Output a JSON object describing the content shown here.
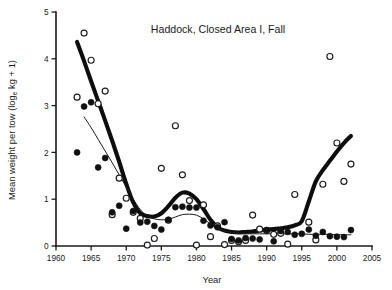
{
  "chart_data": {
    "type": "scatter",
    "title": "Haddock, Closed Area I, Fall",
    "xlabel": "Year",
    "ylabel_main": "Mean weight per tow (log",
    "ylabel_sub": "e",
    "ylabel_tail": " kg + 1)",
    "ylabel_full": "Mean weight per tow (log e kg + 1)",
    "xlim": [
      1960,
      2005
    ],
    "ylim": [
      0,
      5
    ],
    "xticks": [
      1960,
      1965,
      1970,
      1975,
      1980,
      1985,
      1990,
      1995,
      2000,
      2005
    ],
    "yticks": [
      0,
      1,
      2,
      3,
      4,
      5
    ],
    "grid": false,
    "legend": "none",
    "series": [
      {
        "name": "Closed Area I (closed circles)",
        "marker": "filled-circle",
        "color": "#101010",
        "points": [
          [
            1963,
            2.0
          ],
          [
            1964,
            2.98
          ],
          [
            1965,
            3.07
          ],
          [
            1966,
            1.68
          ],
          [
            1967,
            1.88
          ],
          [
            1968,
            0.72
          ],
          [
            1969,
            0.86
          ],
          [
            1970,
            0.37
          ],
          [
            1971,
            0.75
          ],
          [
            1972,
            0.5
          ],
          [
            1973,
            0.52
          ],
          [
            1974,
            0.43
          ],
          [
            1975,
            0.35
          ],
          [
            1976,
            0.56
          ],
          [
            1977,
            0.83
          ],
          [
            1978,
            0.84
          ],
          [
            1979,
            0.82
          ],
          [
            1980,
            0.82
          ],
          [
            1981,
            0.54
          ],
          [
            1982,
            0.44
          ],
          [
            1983,
            0.4
          ],
          [
            1984,
            0.51
          ],
          [
            1985,
            0.15
          ],
          [
            1986,
            0.12
          ],
          [
            1987,
            0.17
          ],
          [
            1988,
            0.16
          ],
          [
            1989,
            0.14
          ],
          [
            1990,
            0.34
          ],
          [
            1991,
            0.1
          ],
          [
            1992,
            0.32
          ],
          [
            1993,
            0.3
          ],
          [
            1994,
            0.24
          ],
          [
            1995,
            0.26
          ],
          [
            1996,
            0.35
          ],
          [
            1997,
            0.22
          ],
          [
            1998,
            0.3
          ],
          [
            1999,
            0.21
          ],
          [
            2000,
            0.2
          ],
          [
            2001,
            0.19
          ],
          [
            2002,
            0.34
          ]
        ]
      },
      {
        "name": "Open area (open circles)",
        "marker": "open-circle",
        "color": "#1a1a1a",
        "points": [
          [
            1963,
            3.18
          ],
          [
            1964,
            4.55
          ],
          [
            1965,
            3.97
          ],
          [
            1966,
            3.04
          ],
          [
            1967,
            3.31
          ],
          [
            1969,
            1.45
          ],
          [
            1968,
            0.67
          ],
          [
            1970,
            1.02
          ],
          [
            1971,
            0.72
          ],
          [
            1972,
            0.59
          ],
          [
            1973,
            0.02
          ],
          [
            1974,
            0.16
          ],
          [
            1975,
            1.66
          ],
          [
            1976,
            0.55
          ],
          [
            1977,
            2.57
          ],
          [
            1978,
            1.52
          ],
          [
            1979,
            0.97
          ],
          [
            1980,
            0.02
          ],
          [
            1981,
            0.88
          ],
          [
            1982,
            0.2
          ],
          [
            1983,
            0.43
          ],
          [
            1984,
            0.03
          ],
          [
            1985,
            0.12
          ],
          [
            1986,
            0.09
          ],
          [
            1987,
            0.12
          ],
          [
            1988,
            0.66
          ],
          [
            1989,
            0.36
          ],
          [
            1990,
            0.33
          ],
          [
            1991,
            0.25
          ],
          [
            1992,
            0.27
          ],
          [
            1993,
            0.04
          ],
          [
            1994,
            1.1
          ],
          [
            1996,
            0.51
          ],
          [
            1997,
            0.13
          ],
          [
            1998,
            1.32
          ],
          [
            1999,
            4.05
          ],
          [
            2000,
            2.2
          ],
          [
            2001,
            1.38
          ],
          [
            2002,
            1.75
          ]
        ]
      }
    ],
    "trend_lines": [
      {
        "name": "thick-trend-line",
        "style": "thick",
        "points": [
          [
            1963,
            4.36
          ],
          [
            1964,
            3.95
          ],
          [
            1965,
            3.52
          ],
          [
            1966,
            3.1
          ],
          [
            1967,
            2.68
          ],
          [
            1968,
            2.25
          ],
          [
            1969,
            1.8
          ],
          [
            1970,
            1.33
          ],
          [
            1971,
            0.93
          ],
          [
            1972,
            0.7
          ],
          [
            1973,
            0.64
          ],
          [
            1974,
            0.63
          ],
          [
            1975,
            0.7
          ],
          [
            1976,
            0.85
          ],
          [
            1977,
            1.03
          ],
          [
            1978,
            1.14
          ],
          [
            1979,
            1.12
          ],
          [
            1980,
            1.0
          ],
          [
            1981,
            0.79
          ],
          [
            1982,
            0.56
          ],
          [
            1983,
            0.4
          ],
          [
            1984,
            0.33
          ],
          [
            1985,
            0.3
          ],
          [
            1986,
            0.29
          ],
          [
            1987,
            0.3
          ],
          [
            1988,
            0.31
          ],
          [
            1989,
            0.33
          ],
          [
            1990,
            0.35
          ],
          [
            1991,
            0.36
          ],
          [
            1992,
            0.38
          ],
          [
            1993,
            0.4
          ],
          [
            1994,
            0.44
          ],
          [
            1995,
            0.53
          ],
          [
            1996,
            0.95
          ],
          [
            1997,
            1.38
          ],
          [
            1998,
            1.62
          ],
          [
            1999,
            1.82
          ],
          [
            2000,
            2.02
          ],
          [
            2001,
            2.2
          ],
          [
            2002,
            2.35
          ]
        ]
      },
      {
        "name": "thin-trend-line",
        "style": "thin",
        "points": [
          [
            1964,
            2.76
          ],
          [
            1965,
            2.53
          ],
          [
            1966,
            2.28
          ],
          [
            1967,
            2.03
          ],
          [
            1968,
            1.78
          ],
          [
            1969,
            1.52
          ],
          [
            1970,
            1.26
          ],
          [
            1971,
            1.0
          ],
          [
            1972,
            0.78
          ],
          [
            1973,
            0.64
          ],
          [
            1974,
            0.58
          ],
          [
            1975,
            0.56
          ],
          [
            1976,
            0.57
          ],
          [
            1977,
            0.62
          ],
          [
            1978,
            0.67
          ],
          [
            1979,
            0.68
          ],
          [
            1980,
            0.66
          ],
          [
            1981,
            0.58
          ],
          [
            1982,
            0.47
          ],
          [
            1983,
            0.38
          ],
          [
            1984,
            0.32
          ],
          [
            1985,
            0.29
          ],
          [
            1986,
            0.27
          ],
          [
            1987,
            0.26
          ],
          [
            1988,
            0.26
          ],
          [
            1989,
            0.26
          ],
          [
            1990,
            0.26
          ],
          [
            1991,
            0.26
          ],
          [
            1992,
            0.26
          ],
          [
            1993,
            0.26
          ],
          [
            1994,
            0.26
          ],
          [
            1995,
            0.26
          ],
          [
            1996,
            0.25
          ],
          [
            1997,
            0.25
          ],
          [
            1998,
            0.25
          ],
          [
            1999,
            0.25
          ],
          [
            2000,
            0.24
          ],
          [
            2001,
            0.24
          ],
          [
            2002,
            0.24
          ]
        ]
      }
    ]
  }
}
